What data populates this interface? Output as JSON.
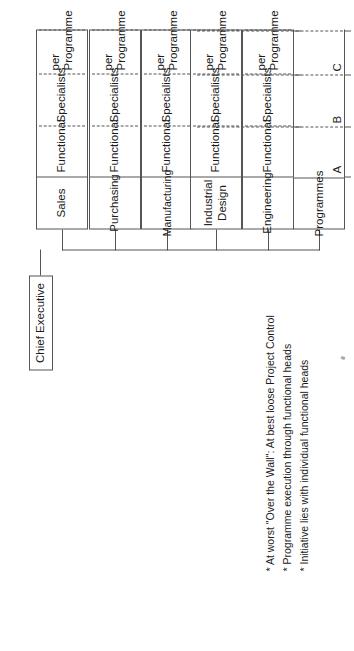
{
  "diagram": {
    "root": {
      "label": "Chief Executive"
    },
    "column_headers": [
      "Functional",
      "Specialists",
      "per Programme"
    ],
    "programme_label": "Programmes",
    "programme_rows": [
      "A",
      "B",
      "C"
    ],
    "departments": [
      {
        "name": "Engineering",
        "cells": [
          "Functional",
          "Specialists",
          "per\nProgramme"
        ]
      },
      {
        "name": "Industrial\nDesign",
        "cells": [
          "Functional",
          "Specialists",
          "per\nProgramme"
        ]
      },
      {
        "name": "Manufacturing",
        "cells": [
          "Functional",
          "Specialists",
          "per\nProgramme"
        ]
      },
      {
        "name": "Purchasing",
        "cells": [
          "Functional",
          "Specialists",
          "per\nProgramme"
        ]
      },
      {
        "name": "Sales",
        "cells": [
          "Functional",
          "Specialists",
          "per\nProgramme"
        ]
      }
    ]
  },
  "notes": [
    "* At worst \"Over the Wall\": At best loose Project Control",
    "* Programme execution through functional heads",
    "* Initiative lies with individual functional heads"
  ],
  "colors": {
    "line": "#555555",
    "text": "#1c1c1c",
    "background": "#ffffff"
  }
}
